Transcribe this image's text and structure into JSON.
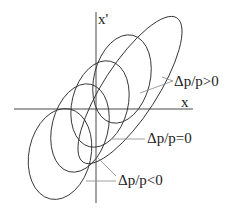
{
  "diagram": {
    "axes": {
      "x_label": "x",
      "y_label": "x'"
    },
    "labels": {
      "positive": "Δp/p>0",
      "zero": "Δp/p=0",
      "negative": "Δp/p<0"
    },
    "colors": {
      "stroke": "#333333",
      "leader": "#888888",
      "text": "#222222"
    }
  }
}
